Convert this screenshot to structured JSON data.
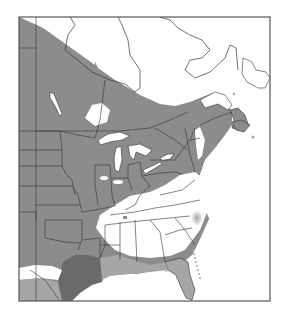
{
  "map": {
    "type": "species-range-map",
    "region": "Eastern North America",
    "colors": {
      "background": "#ffffff",
      "range_primary": "#8c8c8c",
      "range_dark": "#6a6a6a",
      "range_light": "#a6a6a6",
      "outside_range": "#ffffff",
      "border": "#333333",
      "frame": "#555555"
    },
    "frame": {
      "x": 19,
      "y": 17,
      "width": 251,
      "height": 284
    }
  }
}
